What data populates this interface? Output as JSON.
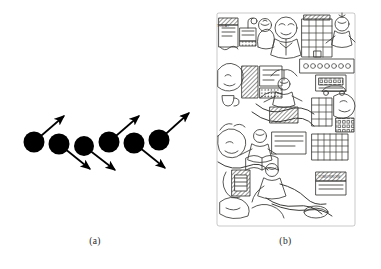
{
  "figure": {
    "panels": [
      {
        "id": "a",
        "caption": "(a)",
        "kind": "schematic-diagram",
        "description": "Row of six filled black circles arranged along a shallow rising diagonal, each with a straight arrow emerging from its centre; arrows alternate between pointing up-to-the-right and down-to-the-right.",
        "node_count": 6,
        "node_color": "#000000",
        "arrow_color": "#000000",
        "nodes": [
          {
            "index": 1,
            "cx": 24,
            "cy": 47,
            "r": 10.5,
            "arrow": {
              "direction": "up-right",
              "dx": 32,
              "dy": -28
            }
          },
          {
            "index": 2,
            "cx": 49,
            "cy": 49,
            "r": 10.5,
            "arrow": {
              "direction": "down-right",
              "dx": 33,
              "dy": 27
            }
          },
          {
            "index": 3,
            "cx": 74,
            "cy": 51,
            "r": 10.0,
            "arrow": {
              "direction": "down-right",
              "dx": 33,
              "dy": 26
            }
          },
          {
            "index": 4,
            "cx": 99,
            "cy": 47,
            "r": 10.5,
            "arrow": {
              "direction": "up-right",
              "dx": 32,
              "dy": -28
            }
          },
          {
            "index": 5,
            "cx": 124,
            "cy": 48,
            "r": 10.5,
            "arrow": {
              "direction": "down-right",
              "dx": 33,
              "dy": 27
            }
          },
          {
            "index": 6,
            "cx": 149,
            "cy": 45,
            "r": 10.5,
            "arrow": {
              "direction": "up-right",
              "dx": 33,
              "dy": -29
            }
          }
        ]
      },
      {
        "id": "b",
        "caption": "(b)",
        "kind": "line-art-illustration",
        "description": "Dense black-and-white pen-and-ink cartoon panel crowded with stylised human figures, faces, office desks, computer terminals, telephones, filing cabinets, office buildings, vehicles and connecting cables, filling a roughly square frame.",
        "style": "monochrome ink line drawing, heavy cross-hatching",
        "line_color": "#3a3a38",
        "fill_color": "#ffffff",
        "labels": [
          {
            "text": "TODAY",
            "position": "top-left"
          },
          {
            "text": "TOMORROW",
            "position": "bottom-right"
          }
        ]
      }
    ]
  }
}
